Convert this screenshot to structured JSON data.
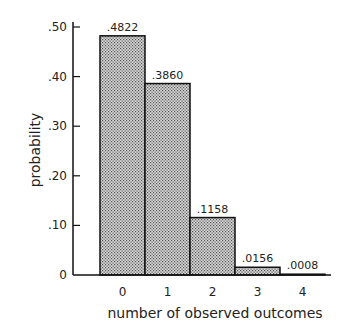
{
  "chart_data": {
    "type": "bar",
    "title": "",
    "xlabel": "number of observed outcomes",
    "ylabel": "probability",
    "categories": [
      "0",
      "1",
      "2",
      "3",
      "4"
    ],
    "values": [
      0.4822,
      0.386,
      0.1158,
      0.0156,
      0.0008
    ],
    "value_labels": [
      ".4822",
      ".3860",
      ".1158",
      ".0156",
      ".0008"
    ],
    "ylim": [
      0,
      0.5
    ],
    "yticks": [
      0,
      0.1,
      0.2,
      0.3,
      0.4,
      0.5
    ],
    "ytick_labels": [
      "0",
      ".10",
      ".20",
      ".30",
      ".40",
      ".50"
    ],
    "grid": false,
    "legend": null,
    "bar_fill": "#bdbdbd",
    "bar_edge": "#111111"
  }
}
